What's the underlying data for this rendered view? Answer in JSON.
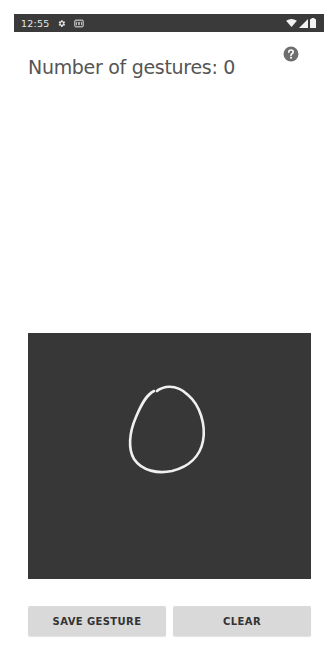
{
  "status_bar": {
    "time": "12:55",
    "left_icons": [
      "settings-gear-icon",
      "sim-card-icon"
    ],
    "right_icons": [
      "wifi-icon",
      "cellular-signal-icon",
      "battery-icon"
    ]
  },
  "header": {
    "title": "Number of gestures: 0",
    "gesture_count": 0,
    "help_icon": "help-circle-icon"
  },
  "gesture_canvas": {
    "background_color": "#373737",
    "stroke_color": "#f0f0f0",
    "stroke": "open circle drawn by user"
  },
  "buttons": {
    "save_label": "SAVE GESTURE",
    "clear_label": "CLEAR"
  },
  "colors": {
    "status_bar_bg": "#3a3a3a",
    "title_text": "#555555",
    "button_bg": "#d9d9d9",
    "button_text": "#333333"
  }
}
